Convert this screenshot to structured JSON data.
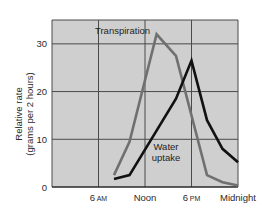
{
  "chart_data": {
    "type": "line",
    "title": "",
    "xlabel": "",
    "ylabel": "Relative rate (grams per 2 hours)",
    "ylabel_lines": [
      "Relative rate",
      "(grams per 2 hours)"
    ],
    "xlim_hours": [
      0,
      24
    ],
    "ylim": [
      0,
      35
    ],
    "grid": true,
    "y_ticks": [
      0,
      10,
      20,
      30
    ],
    "x_ticks": [
      {
        "hour": 6,
        "label": "6",
        "suffix": "AM"
      },
      {
        "hour": 12,
        "label": "Noon",
        "suffix": ""
      },
      {
        "hour": 18,
        "label": "6",
        "suffix": "PM"
      },
      {
        "hour": 24,
        "label": "Midnight",
        "suffix": ""
      }
    ],
    "series": [
      {
        "name": "Transpiration",
        "color": "#707070",
        "x_hours": [
          8,
          10,
          13.5,
          16,
          20,
          22,
          24
        ],
        "values": [
          2.5,
          9.5,
          32,
          27.5,
          2.5,
          1,
          0.3
        ]
      },
      {
        "name": "Water uptake",
        "color": "#111111",
        "x_hours": [
          8,
          10,
          16,
          18,
          20,
          22,
          24
        ],
        "values": [
          1.7,
          2.5,
          18.5,
          26.5,
          14,
          8,
          5.2
        ]
      }
    ],
    "annotations": [
      {
        "text": "Transpiration",
        "series": "Transpiration"
      },
      {
        "text": "Water uptake",
        "series": "Water uptake",
        "lines": [
          "Water",
          "uptake"
        ]
      }
    ]
  },
  "colors": {
    "plot_background": "#cfcfcf",
    "gridline": "#4a4a4a",
    "axis": "#2a2a2a"
  }
}
